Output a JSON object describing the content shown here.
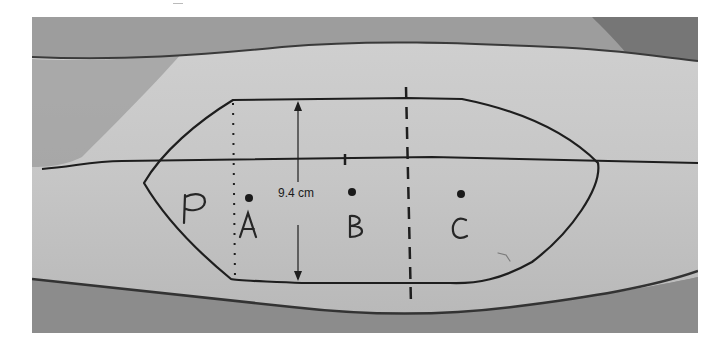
{
  "figure": {
    "measurement_label": "9.4 cm",
    "markers": [
      {
        "id": "P",
        "label": "P"
      },
      {
        "id": "A",
        "label": "A"
      },
      {
        "id": "B",
        "label": "B"
      },
      {
        "id": "C",
        "label": "C"
      }
    ],
    "colors": {
      "skin": "#c4c4c4",
      "background_top": "#8e8e8e",
      "background_bottom": "#9a9a9a",
      "ink": "#1e1e1e"
    }
  }
}
